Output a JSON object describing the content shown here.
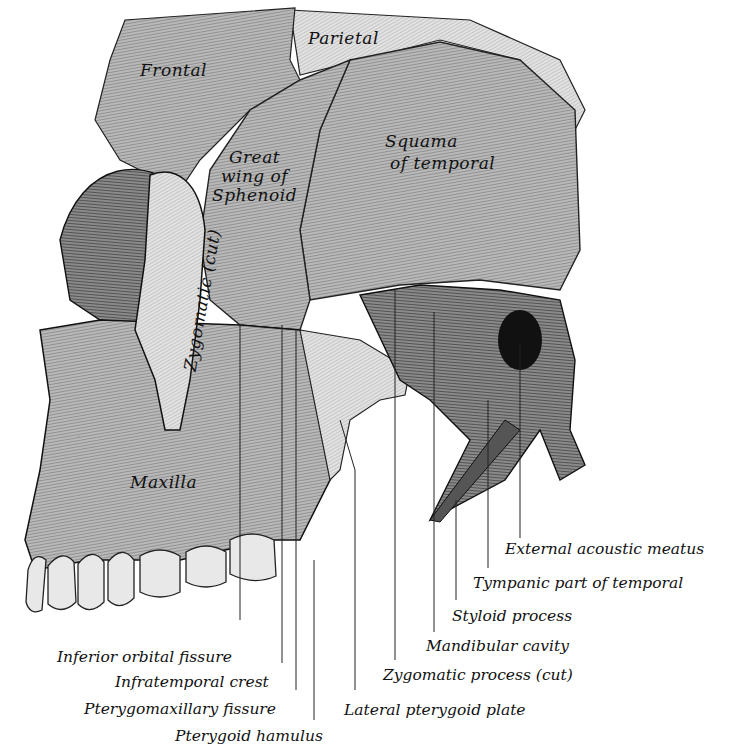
{
  "figure": {
    "bone_labels": [
      {
        "id": "frontal",
        "text": "Frontal",
        "x": 140,
        "y": 60
      },
      {
        "id": "parietal",
        "text": "Parietal",
        "x": 308,
        "y": 28
      },
      {
        "id": "great-wing",
        "line1": "Great",
        "line2": "wing of",
        "line3": "Sphenoid",
        "x": 212,
        "y": 148
      },
      {
        "id": "squama",
        "line1": "Squama",
        "line2": "of temporal",
        "x": 385,
        "y": 130
      },
      {
        "id": "zygomatic-cut",
        "text": "Zygomatic (cut)",
        "x": 185,
        "y": 330,
        "rotate": -80
      },
      {
        "id": "maxilla",
        "text": "Maxilla",
        "x": 130,
        "y": 472
      }
    ],
    "callouts": [
      {
        "id": "external-acoustic-meatus",
        "text": "External acoustic meatus",
        "x": 505,
        "y": 540,
        "line_x": 520,
        "line_top": 345,
        "line_bottom": 538
      },
      {
        "id": "tympanic-part",
        "text": "Tympanic part of temporal",
        "x": 473,
        "y": 574,
        "line_x": 488,
        "line_top": 400,
        "line_bottom": 568
      },
      {
        "id": "styloid-process",
        "text": "Styloid process",
        "x": 452,
        "y": 607,
        "line_x": 456,
        "line_top": 500,
        "line_bottom": 600
      },
      {
        "id": "mandibular-cavity",
        "text": "Mandibular cavity",
        "x": 426,
        "y": 637,
        "line_x": 434,
        "line_top": 312,
        "line_bottom": 632
      },
      {
        "id": "zygomatic-process",
        "text": "Zygomatic process (cut)",
        "x": 383,
        "y": 666,
        "line_x": 395,
        "line_top": 290,
        "line_bottom": 660
      },
      {
        "id": "lateral-pterygoid-plate",
        "text": "Lateral pterygoid plate",
        "x": 344,
        "y": 701,
        "line_x": 355,
        "line_top": 470,
        "line_bottom": 690
      },
      {
        "id": "inferior-orbital-fissure",
        "text": "Inferior orbital fissure",
        "x": 57,
        "y": 648,
        "line_x": 240,
        "line_top": 325,
        "line_bottom": 620
      },
      {
        "id": "infratemporal-crest",
        "text": "Infratemporal crest",
        "x": 115,
        "y": 673,
        "line_x": 282,
        "line_top": 325,
        "line_bottom": 663
      },
      {
        "id": "pterygomaxillary-fissure",
        "text": "Pterygomaxillary fissure",
        "x": 84,
        "y": 700,
        "line_x": 296,
        "line_top": 330,
        "line_bottom": 690
      },
      {
        "id": "pterygoid-hamulus",
        "text": "Pterygoid hamulus",
        "x": 175,
        "y": 727,
        "line_x": 314,
        "line_top": 560,
        "line_bottom": 720
      }
    ]
  }
}
